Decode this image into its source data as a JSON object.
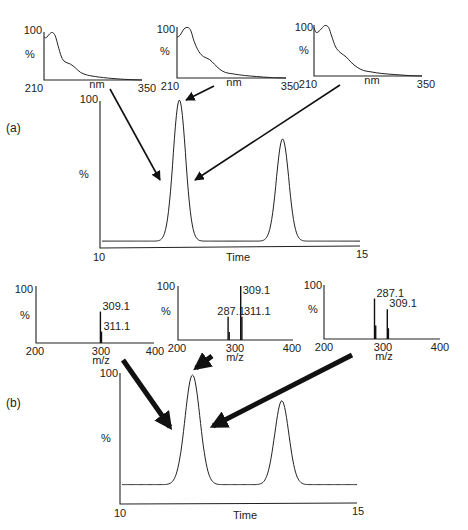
{
  "figure": {
    "panel_a_label": "(a)",
    "panel_b_label": "(b)"
  },
  "chart_data": [
    {
      "id": "uv_spectrum_1",
      "type": "line",
      "title": "",
      "xlabel": "nm",
      "ylabel": "%",
      "x_ticks": [
        "210",
        "350"
      ],
      "y_ticks": [
        "100"
      ],
      "xlim": [
        210,
        350
      ],
      "ylim": [
        0,
        100
      ],
      "x": [
        210,
        213,
        218,
        222,
        226,
        230,
        235,
        240,
        248,
        255,
        262,
        270,
        280,
        295,
        310,
        330,
        350
      ],
      "values": [
        90,
        88,
        96,
        99,
        92,
        72,
        48,
        38,
        33,
        25,
        16,
        11,
        8,
        5,
        3,
        1,
        0
      ]
    },
    {
      "id": "uv_spectrum_2",
      "type": "line",
      "title": "",
      "xlabel": "nm",
      "ylabel": "%",
      "x_ticks": [
        "210",
        "350"
      ],
      "y_ticks": [
        "100"
      ],
      "xlim": [
        210,
        350
      ],
      "ylim": [
        0,
        100
      ],
      "x": [
        210,
        214,
        219,
        224,
        228,
        232,
        238,
        244,
        252,
        258,
        265,
        272,
        282,
        297,
        312,
        330,
        350
      ],
      "values": [
        80,
        84,
        96,
        99,
        92,
        72,
        52,
        42,
        36,
        27,
        17,
        11,
        8,
        5,
        3,
        1,
        0
      ]
    },
    {
      "id": "uv_spectrum_3",
      "type": "line",
      "title": "",
      "xlabel": "nm",
      "ylabel": "%",
      "x_ticks": [
        "210",
        "350"
      ],
      "y_ticks": [
        "100"
      ],
      "xlim": [
        210,
        350
      ],
      "ylim": [
        0,
        100
      ],
      "x": [
        210,
        213,
        218,
        224,
        229,
        233,
        238,
        244,
        252,
        258,
        266,
        274,
        284,
        298,
        314,
        332,
        350
      ],
      "values": [
        95,
        85,
        90,
        99,
        95,
        78,
        57,
        46,
        37,
        27,
        17,
        11,
        8,
        5,
        3,
        1,
        0
      ]
    },
    {
      "id": "uv_chromatogram_a",
      "type": "line",
      "title": "",
      "xlabel": "Time",
      "ylabel": "%",
      "x_ticks": [
        "10",
        "15"
      ],
      "y_ticks": [
        "100"
      ],
      "xlim": [
        10,
        15
      ],
      "ylim": [
        0,
        100
      ],
      "baseline": 2,
      "peaks": [
        {
          "center": 11.5,
          "height": 100,
          "width": 0.12
        },
        {
          "center": 13.5,
          "height": 73,
          "width": 0.12
        }
      ]
    },
    {
      "id": "mass_spectrum_1",
      "type": "bar",
      "title": "",
      "xlabel": "m/z",
      "ylabel": "%",
      "x_ticks": [
        "200",
        "300",
        "400"
      ],
      "y_ticks": [
        "100"
      ],
      "xlim": [
        200,
        400
      ],
      "ylim": [
        0,
        100
      ],
      "peaks": [
        {
          "mz": 309.1,
          "intensity": 55,
          "label": "309.1"
        },
        {
          "mz": 311.1,
          "intensity": 20,
          "label": "311.1"
        }
      ]
    },
    {
      "id": "mass_spectrum_2",
      "type": "bar",
      "title": "",
      "xlabel": "m/z",
      "ylabel": "%",
      "x_ticks": [
        "200",
        "300",
        "400"
      ],
      "y_ticks": [
        "100"
      ],
      "xlim": [
        200,
        400
      ],
      "ylim": [
        0,
        100
      ],
      "peaks": [
        {
          "mz": 287.1,
          "intensity": 43,
          "label": "287.1"
        },
        {
          "mz": 289.1,
          "intensity": 15,
          "label": ""
        },
        {
          "mz": 309.1,
          "intensity": 100,
          "label": "309.1"
        },
        {
          "mz": 311.1,
          "intensity": 43,
          "label": "311.1"
        }
      ]
    },
    {
      "id": "mass_spectrum_3",
      "type": "bar",
      "title": "",
      "xlabel": "m/z",
      "ylabel": "%",
      "x_ticks": [
        "200",
        "300",
        "400"
      ],
      "y_ticks": [
        "100"
      ],
      "xlim": [
        200,
        400
      ],
      "ylim": [
        0,
        100
      ],
      "peaks": [
        {
          "mz": 287.1,
          "intensity": 75,
          "label": "287.1"
        },
        {
          "mz": 289.1,
          "intensity": 25,
          "label": ""
        },
        {
          "mz": 309.1,
          "intensity": 55,
          "label": "309.1"
        },
        {
          "mz": 311.1,
          "intensity": 20,
          "label": ""
        }
      ]
    },
    {
      "id": "ms_chromatogram_b",
      "type": "line",
      "title": "",
      "xlabel": "Time",
      "ylabel": "%",
      "x_ticks": [
        "10",
        "15"
      ],
      "y_ticks": [
        "100"
      ],
      "xlim": [
        10,
        15
      ],
      "ylim": [
        0,
        100
      ],
      "baseline": 15,
      "peaks": [
        {
          "center": 11.5,
          "height": 100,
          "width": 0.16
        },
        {
          "center": 13.4,
          "height": 80,
          "width": 0.15
        }
      ]
    }
  ],
  "arrows": {
    "uv": [
      {
        "from": "uv_spectrum_1",
        "to": "uv_chromatogram_a",
        "target": "peak 1 leading edge"
      },
      {
        "from": "uv_spectrum_2",
        "to": "uv_chromatogram_a",
        "target": "peak 1 apex"
      },
      {
        "from": "uv_spectrum_3",
        "to": "uv_chromatogram_a",
        "target": "peak 1 trailing edge"
      }
    ],
    "ms": [
      {
        "from": "mass_spectrum_1",
        "to": "ms_chromatogram_b",
        "target": "peak 1 leading edge"
      },
      {
        "from": "mass_spectrum_2",
        "to": "ms_chromatogram_b",
        "target": "peak 1 apex"
      },
      {
        "from": "mass_spectrum_3",
        "to": "ms_chromatogram_b",
        "target": "peak 1 trailing edge"
      }
    ]
  }
}
